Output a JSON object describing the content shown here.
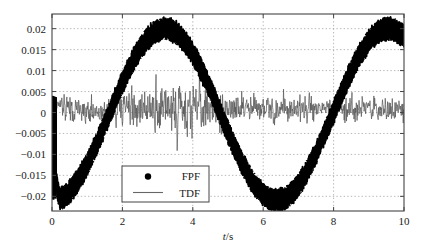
{
  "chart_data": {
    "type": "line",
    "title": "",
    "xlabel": "t/s",
    "ylabel": "",
    "xlim": [
      0,
      10
    ],
    "ylim": [
      -0.0235,
      0.0235
    ],
    "grid": true,
    "grid_style": "dotted",
    "legend_position": "lower-left-inside",
    "xticks": [
      0,
      2,
      4,
      6,
      8,
      10
    ],
    "xtick_labels": [
      "0",
      "2",
      "4",
      "6",
      "8",
      "10"
    ],
    "yticks": [
      0.02,
      0.015,
      0.01,
      0.005,
      0,
      -0.005,
      -0.01,
      -0.015,
      -0.02
    ],
    "ytick_labels": [
      "0.02",
      "0.015",
      "0.01",
      "0.005",
      "0",
      "−0.005",
      "−0.01",
      "−0.015",
      "−0.02"
    ],
    "series": [
      {
        "name": "FPF",
        "style": "dots-thick-band",
        "color": "#000000",
        "description": "Thick black scattered dot band tracing a sinusoid of period ~6.3 s, amplitude ~0.021, plus band half-thickness ~0.0015. Starts near 0 at t=0 with a sharp vertical transient down to -0.021.",
        "model": {
          "amplitude": 0.0205,
          "period": 6.35,
          "phase_shift": 1.62,
          "offset": -0.0005,
          "band_half_width": 0.0016,
          "transient_start_t": 0.0,
          "transient_end_t": 0.22,
          "transient_from": 0.0,
          "transient_to": -0.021
        },
        "key_points": [
          {
            "t": 0.0,
            "y": 0.0
          },
          {
            "t": 0.3,
            "y": -0.0215
          },
          {
            "t": 1.6,
            "y": -0.011
          },
          {
            "t": 3.1,
            "y": 0.0215
          },
          {
            "t": 4.7,
            "y": 0.0
          },
          {
            "t": 6.3,
            "y": -0.0225
          },
          {
            "t": 7.9,
            "y": 0.0
          },
          {
            "t": 9.3,
            "y": 0.021
          },
          {
            "t": 10.0,
            "y": 0.0145
          }
        ]
      },
      {
        "name": "TDF",
        "style": "thin-noisy-line",
        "color": "#555555",
        "description": "Thin grey noisy trace oscillating about zero, noise amplitude ~0.004 baseline rising to ~0.008 around t=3-4.",
        "model": {
          "mean": 0.0008,
          "noise_amplitude": 0.0042,
          "noise_amplitude_peak": 0.0085,
          "peak_center_t": 3.5
        },
        "range": [
          -0.0085,
          0.0095
        ]
      }
    ],
    "legend": [
      {
        "label": "FPF",
        "marker": "dot"
      },
      {
        "label": "TDF",
        "marker": "line"
      }
    ]
  },
  "axes": {
    "x_axis_label": "t/s",
    "x_axis_label_italic_part": "t",
    "x_axis_label_rest": "/s"
  },
  "colors": {
    "background": "#ffffff",
    "frame": "#444444",
    "grid": "#999999",
    "fpf": "#000000",
    "tdf": "#555555",
    "text": "#1a1a1a"
  }
}
